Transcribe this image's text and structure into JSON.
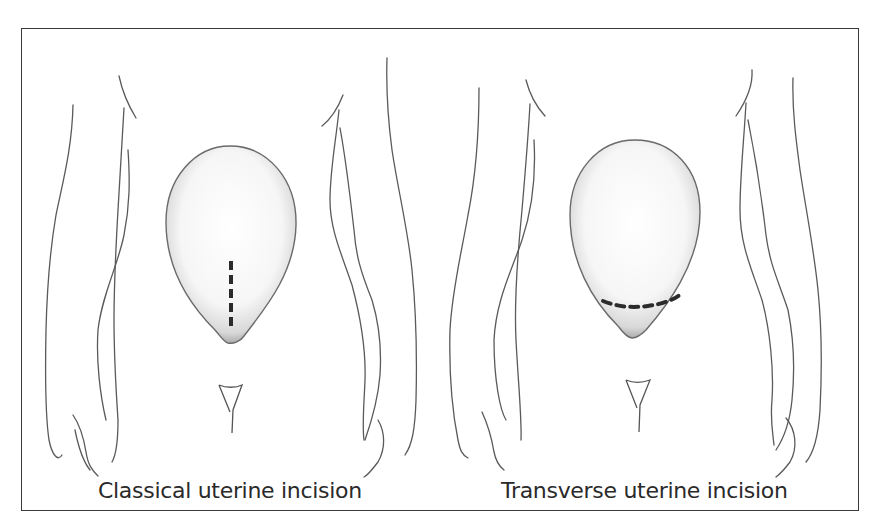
{
  "figure": {
    "panels": [
      {
        "caption": "Classical uterine incision",
        "incision_orientation": "vertical"
      },
      {
        "caption": "Transverse uterine incision",
        "incision_orientation": "transverse"
      }
    ],
    "colors": {
      "line": "#4a4a4a",
      "incision": "#2b2b2b",
      "frame": "#3a3a3a",
      "background": "#ffffff"
    }
  }
}
